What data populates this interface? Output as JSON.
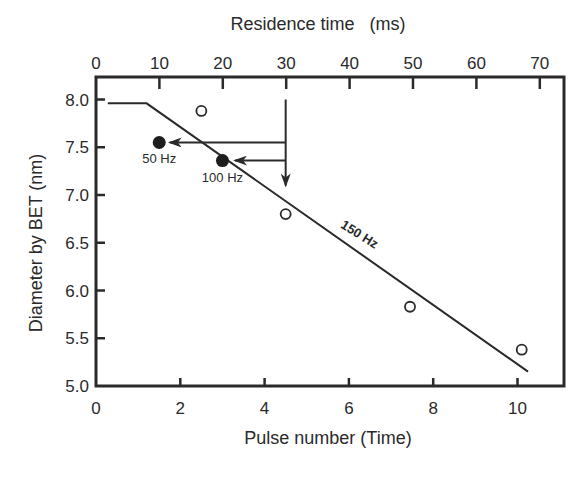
{
  "chart_data": {
    "type": "scatter",
    "title": "",
    "xlabel": "Pulse number (Time)",
    "ylabel": "Diameter by BET (nm)",
    "x2label": "Residence time   (ms)",
    "xlim": [
      0,
      11.05
    ],
    "ylim": [
      5.0,
      8.2
    ],
    "x2lim": [
      0,
      74
    ],
    "xticks": [
      0,
      2,
      4,
      6,
      8,
      10
    ],
    "yticks": [
      5.0,
      5.5,
      6.0,
      6.5,
      7.0,
      7.5,
      8.0
    ],
    "yticklabels": [
      "5.0",
      "5.5",
      "6.0",
      "6.5",
      "7.0",
      "7.5",
      "8.0"
    ],
    "x2ticks": [
      0,
      10,
      20,
      30,
      40,
      50,
      60,
      70
    ],
    "grid": false,
    "legend": null,
    "series": [
      {
        "name": "150 Hz (open circles)",
        "marker": "open-circle",
        "points": [
          {
            "x": 2.5,
            "y": 7.88
          },
          {
            "x": 4.5,
            "y": 6.8
          },
          {
            "x": 7.45,
            "y": 5.83
          },
          {
            "x": 10.1,
            "y": 5.38
          }
        ]
      },
      {
        "name": "50 Hz",
        "marker": "filled-circle",
        "points": [
          {
            "x": 1.5,
            "y": 7.55
          }
        ]
      },
      {
        "name": "100 Hz",
        "marker": "filled-circle",
        "points": [
          {
            "x": 3.0,
            "y": 7.36
          }
        ]
      },
      {
        "name": "150 Hz fit line",
        "marker": "line",
        "points": [
          {
            "x": 0.28,
            "y": 7.96
          },
          {
            "x": 1.2,
            "y": 7.96
          },
          {
            "x": 10.25,
            "y": 5.15
          }
        ]
      }
    ],
    "arrows": [
      {
        "from": {
          "x": 4.5,
          "y": 8.0
        },
        "to": {
          "x": 4.5,
          "y": 7.1
        },
        "note": "vertical arrow at 30 ms residence time"
      },
      {
        "from": {
          "x": 4.5,
          "y": 7.55
        },
        "to": {
          "x": 1.75,
          "y": 7.55
        },
        "note": "arrow to 50 Hz point"
      },
      {
        "from": {
          "x": 4.5,
          "y": 7.36
        },
        "to": {
          "x": 3.3,
          "y": 7.36
        },
        "note": "arrow to 100 Hz point"
      }
    ],
    "annotations": [
      {
        "text": "50 Hz",
        "x": 1.5,
        "y": 7.33
      },
      {
        "text": "100 Hz",
        "x": 3.0,
        "y": 7.14
      },
      {
        "text": "150 Hz",
        "x": 6.2,
        "y": 6.55,
        "rotation": 32,
        "bold": true
      }
    ]
  }
}
